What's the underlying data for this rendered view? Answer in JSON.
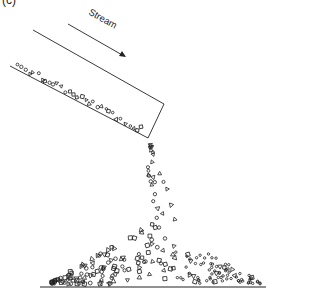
{
  "figure": {
    "panel_label": "(c)",
    "stream_label": "Stream",
    "line_color": "#222222",
    "background": "#ffffff"
  },
  "elements": {
    "trough": "inclined channel carrying a stream of mixed particles (circles, triangles, squares)",
    "falling_particles": "particles falling from the trough outlet",
    "pile": "conical heap of deposited particles on the ground",
    "ground": "horizontal base line"
  },
  "particle_shapes": [
    "circle-icon",
    "triangle-icon",
    "square-icon"
  ]
}
